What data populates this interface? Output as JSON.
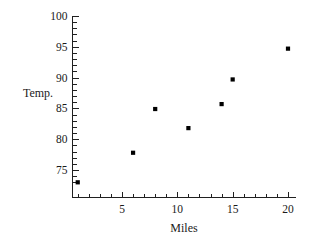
{
  "chart_data": {
    "type": "scatter",
    "title": "",
    "xlabel": "Miles",
    "ylabel": "Temp.",
    "x": [
      1,
      6,
      8,
      11,
      14,
      15,
      20
    ],
    "values": [
      73,
      77.8,
      84.9,
      81.8,
      85.7,
      89.7,
      94.7
    ],
    "points": [
      {
        "x": 1,
        "y": 73
      },
      {
        "x": 6,
        "y": 77.8
      },
      {
        "x": 8,
        "y": 84.9
      },
      {
        "x": 11,
        "y": 81.8
      },
      {
        "x": 14,
        "y": 85.7
      },
      {
        "x": 15,
        "y": 89.7
      },
      {
        "x": 20,
        "y": 94.7
      }
    ],
    "xlim": [
      0,
      20.8
    ],
    "ylim": [
      73,
      100
    ],
    "xticks": [
      5,
      10,
      15,
      20
    ],
    "xtick_labels": [
      "5",
      "10",
      "15",
      "20"
    ],
    "yticks": [
      75,
      80,
      85,
      90,
      95,
      100
    ],
    "ytick_labels": [
      "75",
      "80",
      "85",
      "90",
      "95",
      "100"
    ],
    "x_minor_step": 1,
    "y_minor_step": 1,
    "grid": false,
    "legend": false,
    "marker": "square",
    "marker_color": "#000000",
    "axis_color": "#202020",
    "background": "#ffffff"
  },
  "axes": {
    "y_label": "Temp.",
    "x_label": "Miles"
  }
}
